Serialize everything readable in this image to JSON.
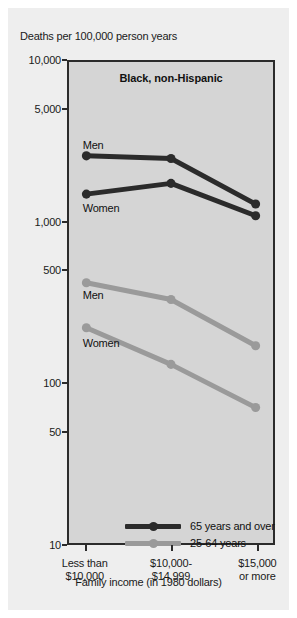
{
  "figure": {
    "y_axis_caption": "Deaths per 100,000 person years",
    "panel_title": "Black, non-Hispanic",
    "x_axis_caption": "Family income (in 1980 dollars)",
    "colors": {
      "dark_series": "#2b2b2b",
      "light_series": "#9a9a9a",
      "plot_background": "#d5d5d5",
      "figure_background": "#eeeeee",
      "axis": "#2b2b2b"
    }
  },
  "chart_data": {
    "type": "line",
    "title": "Black, non-Hispanic",
    "xlabel": "Family income (in 1980 dollars)",
    "ylabel": "Deaths per 100,000 person years",
    "yscale": "log",
    "ylim": [
      10,
      10000
    ],
    "ytick_labels": [
      "10,000",
      "5,000",
      "1,000",
      "500",
      "100",
      "50",
      "10"
    ],
    "ytick_values": [
      10000,
      5000,
      1000,
      500,
      100,
      50,
      10
    ],
    "grid": false,
    "legend_position": "bottom-left",
    "categories": [
      "Less than\n$10,000",
      "$10,000-\n$14,999",
      "$15,000\nor more"
    ],
    "category_lines": [
      [
        "Less than",
        "$10,000"
      ],
      [
        "$10,000-",
        "$14,999"
      ],
      [
        "$15,000",
        "or more"
      ]
    ],
    "legend": [
      {
        "label": "65 years and over",
        "color": "#2b2b2b"
      },
      {
        "label": "25-64 years",
        "color": "#9a9a9a"
      }
    ],
    "series": [
      {
        "name": "65 years and over, Men",
        "annotation": "Men",
        "age_group": "65 years and over",
        "sex": "Men",
        "color": "#2b2b2b",
        "values": [
          2600,
          2500,
          1300
        ]
      },
      {
        "name": "65 years and over, Women",
        "annotation": "Women",
        "age_group": "65 years and over",
        "sex": "Women",
        "color": "#2b2b2b",
        "values": [
          1500,
          1750,
          1100
        ]
      },
      {
        "name": "25-64 years, Men",
        "annotation": "Men",
        "age_group": "25-64 years",
        "sex": "Men",
        "color": "#9a9a9a",
        "values": [
          420,
          330,
          170
        ]
      },
      {
        "name": "25-64 years, Women",
        "annotation": "Women",
        "age_group": "25-64 years",
        "sex": "Women",
        "color": "#9a9a9a",
        "values": [
          220,
          130,
          70
        ]
      }
    ]
  }
}
